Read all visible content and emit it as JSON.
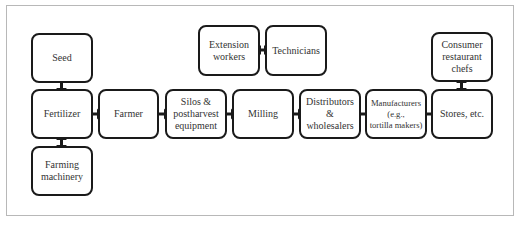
{
  "diagram": {
    "type": "supply-chain-flow",
    "nodes": {
      "seed": {
        "label": "Seed"
      },
      "fertilizer": {
        "label": "Fertilizer"
      },
      "farming_machinery": {
        "label": "Farming\nmachinery"
      },
      "farmer": {
        "label": "Farmer"
      },
      "silos": {
        "label": "Silos &\npostharvest\nequipment"
      },
      "milling": {
        "label": "Milling"
      },
      "distributors": {
        "label": "Distributors\n&\nwholesalers"
      },
      "manufacturers": {
        "label": "Manufacturers\n(e.g.,\ntortilla makers)"
      },
      "stores": {
        "label": "Stores, etc."
      },
      "extension_workers": {
        "label": "Extension\nworkers"
      },
      "technicians": {
        "label": "Technicians"
      },
      "consumer_chefs": {
        "label": "Consumer\nrestaurant\nchefs"
      }
    },
    "edges": [
      {
        "from": "seed",
        "to": "fertilizer",
        "direction": "bidirectional"
      },
      {
        "from": "fertilizer",
        "to": "farming_machinery",
        "direction": "bidirectional"
      },
      {
        "from": "fertilizer",
        "to": "farmer",
        "direction": "bidirectional"
      },
      {
        "from": "farmer",
        "to": "silos",
        "direction": "bidirectional"
      },
      {
        "from": "silos",
        "to": "milling",
        "direction": "bidirectional"
      },
      {
        "from": "milling",
        "to": "distributors",
        "direction": "bidirectional"
      },
      {
        "from": "distributors",
        "to": "manufacturers",
        "direction": "bidirectional"
      },
      {
        "from": "manufacturers",
        "to": "stores",
        "direction": "bidirectional"
      },
      {
        "from": "stores",
        "to": "consumer_chefs",
        "direction": "bidirectional"
      },
      {
        "from": "extension_workers",
        "to": "technicians",
        "direction": "bidirectional"
      }
    ],
    "colors": {
      "border": "#1a1a1a",
      "text": "#333333",
      "frame": "#b8b8b8",
      "background": "#ffffff"
    }
  }
}
